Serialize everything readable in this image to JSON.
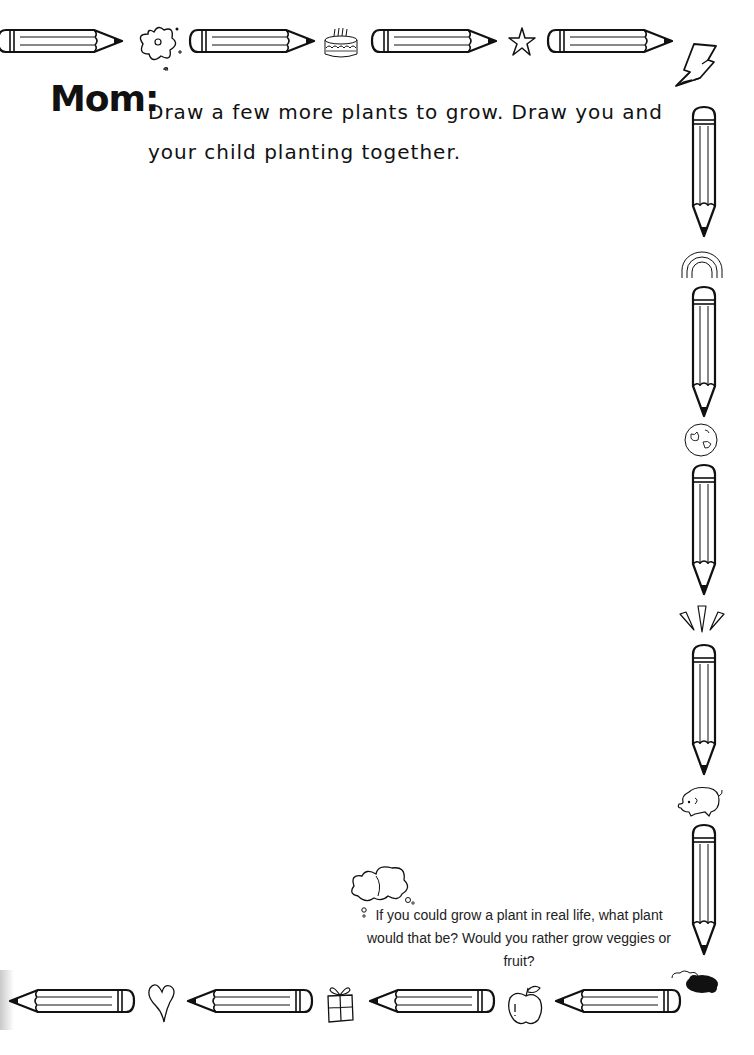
{
  "page": {
    "heading_label": "Mom:",
    "prompt_text": "Draw a few more plants to grow. Draw you and your child planting together.",
    "question_text": "If you could grow a plant in real life, what plant would that be? Would you rather grow veggies or fruit?"
  },
  "border": {
    "top": [
      "pencil-icon",
      "flower-icon",
      "pencil-icon",
      "birthday-cake-icon",
      "pencil-icon",
      "star-icon",
      "pencil-icon",
      "lightning-bolt-icon"
    ],
    "right": [
      "pencil-icon",
      "rainbow-icon",
      "pencil-icon",
      "globe-icon",
      "pencil-icon",
      "sparkle-burst-icon",
      "pencil-icon",
      "elephant-icon",
      "pencil-icon",
      "cloud-scribble-icon"
    ],
    "bottom": [
      "pencil-icon",
      "heart-icon",
      "pencil-icon",
      "gift-box-icon",
      "pencil-icon",
      "apple-icon",
      "pencil-icon"
    ]
  },
  "decorations": {
    "thought_bubble": "thought-cloud-icon"
  },
  "colors": {
    "ink": "#111111",
    "paper": "#ffffff"
  }
}
